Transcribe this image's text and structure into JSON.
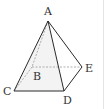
{
  "figure": {
    "type": "pyramid",
    "stroke_color": "#2a2a2a",
    "dashed_color": "#9a9a9a",
    "shade_color": "#f0f0f0",
    "labels": {
      "A": "A",
      "B": "B",
      "C": "C",
      "D": "D",
      "E": "E"
    },
    "solid_edges": [
      "AC",
      "AD",
      "AE",
      "CD",
      "DE"
    ],
    "dashed_edges": [
      "AB",
      "BC",
      "BE"
    ]
  }
}
